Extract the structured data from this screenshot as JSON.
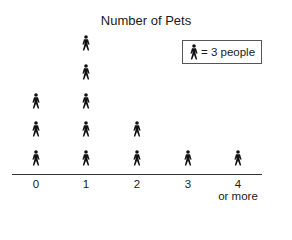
{
  "chart_data": {
    "type": "pictograph",
    "title": "Number of Pets",
    "xlabel": "",
    "ylabel": "",
    "categories": [
      "0",
      "1",
      "2",
      "3",
      "4 or more"
    ],
    "category_labels": [
      {
        "main": "0",
        "sub": ""
      },
      {
        "main": "1",
        "sub": ""
      },
      {
        "main": "2",
        "sub": ""
      },
      {
        "main": "3",
        "sub": ""
      },
      {
        "main": "4",
        "sub": "or more"
      }
    ],
    "icon_counts": [
      3,
      5,
      2,
      1,
      1
    ],
    "values": [
      9,
      15,
      6,
      3,
      3
    ],
    "legend": {
      "icon": "person-icon",
      "text": "= 3 people",
      "people_per_icon": 3
    },
    "grid": false,
    "legend_position": "top-right"
  },
  "colors": {
    "icon": "#111111",
    "axis": "#333333",
    "text": "#1a1a1a",
    "background": "#ffffff"
  }
}
